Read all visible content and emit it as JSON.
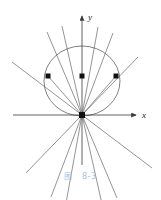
{
  "figure": {
    "caption_label": "图",
    "caption_number": "8-3",
    "caption_color": "#a8c4e0",
    "line_color": "#4a4a4a",
    "axis_color": "#3a3a3a",
    "marker_color": "#111111",
    "background": "#ffffff",
    "axes": {
      "x_label": "x",
      "y_label": "y",
      "origin": {
        "x": 82,
        "y": 115
      },
      "x_axis": {
        "x1": 13,
        "y1": 115,
        "x2": 138,
        "y2": 115
      },
      "y_axis": {
        "x1": 82,
        "y1": 165,
        "x2": 82,
        "y2": 14
      }
    },
    "circle": {
      "cx": 82,
      "cy": 81,
      "rx": 38,
      "ry": 35
    },
    "markers": [
      {
        "name": "left-point",
        "x": 48,
        "y": 76
      },
      {
        "name": "top-point",
        "x": 82,
        "y": 76
      },
      {
        "name": "right-point",
        "x": 116,
        "y": 76
      },
      {
        "name": "origin-point",
        "x": 82,
        "y": 115
      }
    ],
    "rays": [
      {
        "name": "ray-1",
        "x1": 12,
        "y1": 62,
        "x2": 152,
        "y2": 168
      },
      {
        "name": "ray-2",
        "x1": 47,
        "y1": 32,
        "x2": 117,
        "y2": 198
      },
      {
        "name": "ray-3",
        "x1": 62,
        "y1": 26,
        "x2": 102,
        "y2": 204
      },
      {
        "name": "ray-4",
        "x1": 98,
        "y1": 27,
        "x2": 66,
        "y2": 203
      },
      {
        "name": "ray-5",
        "x1": 113,
        "y1": 33,
        "x2": 51,
        "y2": 197
      },
      {
        "name": "ray-6",
        "x1": 138,
        "y1": 57,
        "x2": 26,
        "y2": 173
      },
      {
        "name": "ray-7",
        "x1": 82,
        "y1": 22,
        "x2": 82,
        "y2": 208
      }
    ],
    "chords": [
      {
        "name": "chord-left",
        "x1": 48,
        "y1": 76,
        "x2": 82,
        "y2": 115
      },
      {
        "name": "chord-right",
        "x1": 116,
        "y1": 76,
        "x2": 82,
        "y2": 115
      }
    ]
  }
}
